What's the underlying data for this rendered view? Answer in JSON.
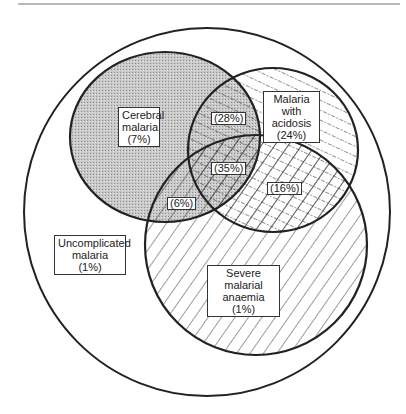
{
  "diagram": {
    "type": "venn",
    "colors": {
      "stroke": "#222222",
      "stipple": "#bdbdbd",
      "background": "#ffffff"
    },
    "outer_set": {
      "label_line1": "Uncomplicated",
      "label_line2": "malaria",
      "pct": "(1%)"
    },
    "sets": [
      {
        "id": "cerebral",
        "label_line1": "Cerebral",
        "label_line2": "malaria",
        "pct": "(7%)",
        "fill": "stippled"
      },
      {
        "id": "acidosis",
        "label_line1": "Malaria with",
        "label_line2": "acidosis",
        "pct": "(24%)",
        "fill": "dotted-diagonal"
      },
      {
        "id": "anaemia",
        "label_line1": "Severe malarial",
        "label_line2": "anaemia (1%)",
        "fill": "diagonal-lines"
      }
    ],
    "overlaps": {
      "cerebral_acidosis": "(28%)",
      "all_three": "(35%)",
      "acidosis_anaemia": "(16%)",
      "cerebral_anaemia": "(6%)"
    }
  }
}
